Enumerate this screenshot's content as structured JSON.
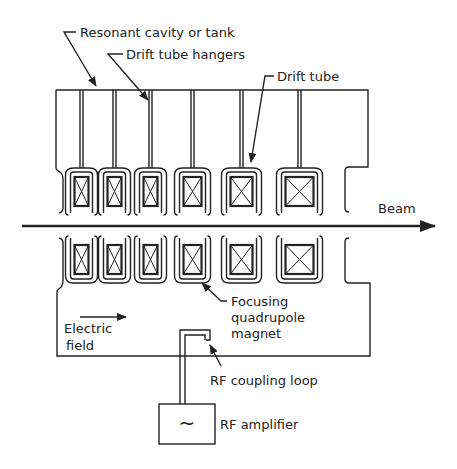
{
  "diagram": {
    "labels": {
      "cavity": "Resonant cavity or tank",
      "hangers": "Drift tube hangers",
      "drift_tube": "Drift tube",
      "beam": "Beam",
      "focusing_1": "Focusing",
      "focusing_2": "quadrupole",
      "focusing_3": "magnet",
      "efield_1": "Electric",
      "efield_2": "field",
      "coupling": "RF coupling loop",
      "amplifier": "RF amplifier",
      "amp_symbol": "~"
    },
    "drift_tube_count_per_side": 6,
    "colors": {
      "ink": "#222222",
      "background": "#ffffff"
    }
  }
}
